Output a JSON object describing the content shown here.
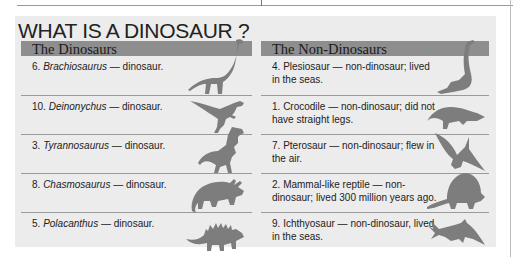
{
  "title": "WHAT IS A DINOSAUR ?",
  "colors": {
    "panel": "#ececec",
    "header_bar": "#8e8e8e",
    "silhouette": "#7d7d7d"
  },
  "dinosaurs": {
    "heading": "The Dinosaurs",
    "items": [
      {
        "number": "6.",
        "name": "Brachiosaurus",
        "desc": " — dinosaur.",
        "icon": "brachiosaurus-icon"
      },
      {
        "number": "10.",
        "name": "Deinonychus",
        "desc": " — dinosaur.",
        "icon": "deinonychus-icon"
      },
      {
        "number": "3.",
        "name": "Tyrannosaurus",
        "desc": " — dinosaur.",
        "icon": "tyrannosaurus-icon"
      },
      {
        "number": "8.",
        "name": "Chasmosaurus",
        "desc": " — dinosaur.",
        "icon": "chasmosaurus-icon"
      },
      {
        "number": "5.",
        "name": "Polacanthus",
        "desc": " — dinosaur.",
        "icon": "polacanthus-icon"
      }
    ]
  },
  "non_dinosaurs": {
    "heading": "The Non-Dinosaurs",
    "items": [
      {
        "number": "4.",
        "name": "Plesiosaur",
        "desc": " — non-dinosaur; lived in the seas.",
        "icon": "plesiosaur-icon"
      },
      {
        "number": "1.",
        "name": "Crocodile",
        "desc": " — non-dinosaur; did not have straight legs.",
        "icon": "crocodile-icon"
      },
      {
        "number": "7.",
        "name": "Pterosaur",
        "desc": " — non-dinosaur; flew in the air.",
        "icon": "pterosaur-icon"
      },
      {
        "number": "2.",
        "name": "Mammal-like reptile",
        "desc": " — non-dinosaur; lived 300 million years ago.",
        "icon": "mammal-like-reptile-icon"
      },
      {
        "number": "9.",
        "name": "Ichthyosaur",
        "desc": " — non-dinosaur, lived in the seas.",
        "icon": "ichthyosaur-icon"
      }
    ]
  }
}
